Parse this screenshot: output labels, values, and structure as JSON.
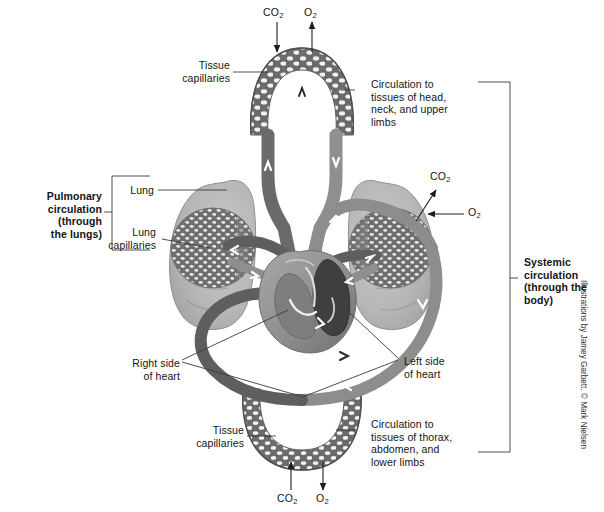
{
  "figure": {
    "colors": {
      "oxygenated_vessel": "#8c8c8c",
      "deoxygenated_vessel": "#5a5a5a",
      "capillary_mesh": "#6e6e6e",
      "lung_tissue": "#b9b9b9",
      "heart_muscle": "#9a9a9a",
      "heart_chamber_dark": "#4a4a4a",
      "label_text": "#141414",
      "leader_line": "#3a3a3a"
    }
  },
  "labels": {
    "pulmonary_circulation": "Pulmonary\ncirculation\n(through\nthe lungs)",
    "systemic_circulation": "Systemic\ncirculation\n(through the\nbody)",
    "lung": "Lung",
    "lung_capillaries": "Lung\ncapillaries",
    "tissue_capillaries_top": "Tissue\ncapillaries",
    "tissue_capillaries_bottom": "Tissue\ncapillaries",
    "circulation_upper": "Circulation to\ntissues of head,\nneck, and upper\nlimbs",
    "circulation_lower": "Circulation to\ntissues of thorax,\nabdomen, and\nlower limbs",
    "right_side_of_heart": "Right side\nof heart",
    "left_side_of_heart": "Left side\nof heart"
  },
  "gas_labels": {
    "top_co2": "CO",
    "top_co2_sub": "2",
    "top_o2": "O",
    "top_o2_sub": "2",
    "lung_co2": "CO",
    "lung_co2_sub": "2",
    "lung_o2": "O",
    "lung_o2_sub": "2",
    "bottom_co2": "CO",
    "bottom_co2_sub": "2",
    "bottom_o2": "O",
    "bottom_o2_sub": "2"
  },
  "credit": "Illustrations by Jamey Garbett. © Mark Nielsen"
}
